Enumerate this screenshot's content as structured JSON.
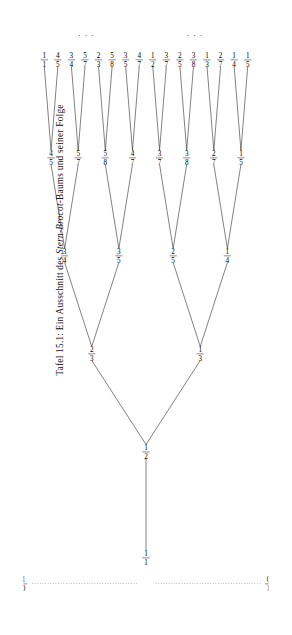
{
  "caption": {
    "prefix": "Tafel 15.1: Ein Ausschnitt des ",
    "emphasis": "Stern-Brocot",
    "suffix": "-Baums und seiner Folge"
  },
  "figure": {
    "root": {
      "num": "1",
      "den": "1"
    },
    "boundary_left": {
      "num": "0",
      "den": "1"
    },
    "boundary_right": {
      "num": "1",
      "den": "0"
    },
    "ellipsis": "⋮",
    "levels": [
      {
        "name": "level-1",
        "nodes": [
          {
            "num": "1",
            "den": "2"
          }
        ]
      },
      {
        "name": "level-2",
        "nodes": [
          {
            "num": "1",
            "den": "3"
          },
          {
            "num": "2",
            "den": "3"
          }
        ]
      },
      {
        "name": "level-3",
        "nodes": [
          {
            "num": "1",
            "den": "4"
          },
          {
            "num": "2",
            "den": "5"
          },
          {
            "num": "3",
            "den": "5"
          },
          {
            "num": "3",
            "den": "4"
          }
        ]
      },
      {
        "name": "level-4",
        "nodes": [
          {
            "num": "1",
            "den": "5"
          },
          {
            "num": "2",
            "den": "7"
          },
          {
            "num": "3",
            "den": "8"
          },
          {
            "num": "3",
            "den": "7"
          },
          {
            "num": "4",
            "den": "7"
          },
          {
            "num": "5",
            "den": "8"
          },
          {
            "num": "5",
            "den": "7"
          },
          {
            "num": "4",
            "den": "5"
          }
        ]
      },
      {
        "name": "level-5",
        "nodes": [
          {
            "num": "1",
            "den": "5"
          },
          {
            "num": "1",
            "den": "4"
          },
          {
            "num": "2",
            "den": "7"
          },
          {
            "num": "1",
            "den": "3"
          },
          {
            "num": "3",
            "den": "8"
          },
          {
            "num": "2",
            "den": "5"
          },
          {
            "num": "3",
            "den": "7"
          },
          {
            "num": "1",
            "den": "2"
          },
          {
            "num": "4",
            "den": "7"
          },
          {
            "num": "3",
            "den": "5"
          },
          {
            "num": "5",
            "den": "8"
          },
          {
            "num": "2",
            "den": "3"
          },
          {
            "num": "5",
            "den": "7"
          },
          {
            "num": "3",
            "den": "4"
          },
          {
            "num": "4",
            "den": "5"
          },
          {
            "num": "1",
            "den": "1"
          }
        ]
      }
    ]
  }
}
